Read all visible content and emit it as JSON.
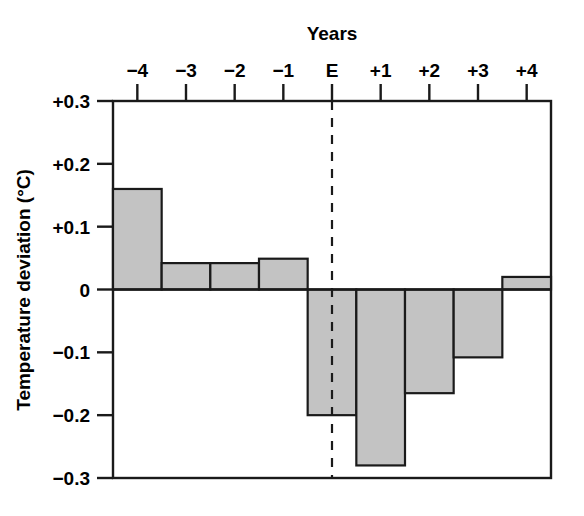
{
  "chart_data": {
    "type": "bar",
    "title": "",
    "xlabel": "Years",
    "ylabel": "Temperature deviation (°C)",
    "categories": [
      "−4",
      "−3",
      "−2",
      "−1",
      "E",
      "+1",
      "+2",
      "+3",
      "+4"
    ],
    "values": [
      0.16,
      0.042,
      0.042,
      0.049,
      -0.2,
      -0.28,
      -0.165,
      -0.108,
      0.02
    ],
    "ylim": [
      -0.3,
      0.3
    ],
    "ytick_values": [
      0.3,
      0.2,
      0.1,
      0,
      -0.1,
      -0.2,
      -0.3
    ],
    "ytick_labels": [
      "+0.3",
      "+0.2",
      "+0.1",
      "0",
      "−0.1",
      "−0.2",
      "−0.3"
    ],
    "xtick_labels": [
      "−4",
      "−3",
      "−2",
      "−1",
      "E",
      "+1",
      "+2",
      "+3",
      "+4"
    ],
    "grid": false,
    "legend": null,
    "xaxis_position": "top",
    "annotations": [
      {
        "name": "event-marker",
        "type": "vertical-dashed-line",
        "at_category": "E",
        "label": ""
      }
    ],
    "bar_fill_color": "#c3c3c3",
    "bar_edge_color": "#1a1a1a",
    "axis_color": "#1a1a1a",
    "background_color": "#ffffff"
  },
  "labels": {
    "x_axis_title": "Years",
    "y_axis_title": "Temperature deviation (°C)"
  }
}
